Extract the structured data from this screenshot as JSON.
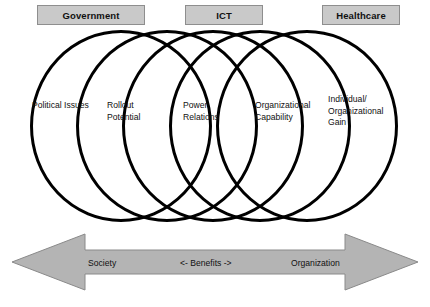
{
  "figure": {
    "type": "venn-diagram",
    "title": "",
    "headers": [
      {
        "id": "government",
        "label": "Government"
      },
      {
        "id": "ict",
        "label": "ICT"
      },
      {
        "id": "healthcare",
        "label": "Healthcare"
      }
    ],
    "regions": [
      {
        "id": "political-issues",
        "lines": [
          "Political Issues"
        ]
      },
      {
        "id": "rollout-potential",
        "lines": [
          "Rollout",
          "Potential"
        ]
      },
      {
        "id": "power-relations",
        "lines": [
          "Power",
          "Relations"
        ]
      },
      {
        "id": "organizational-capability",
        "lines": [
          "Organizational",
          "Capability"
        ]
      },
      {
        "id": "individual-org-gain",
        "lines": [
          "Individual/",
          "Organizational",
          "Gain"
        ]
      }
    ],
    "arrow": {
      "left_label": "Society",
      "center_label": "<-  Benefits  ->",
      "right_label": "Organization"
    },
    "colors": {
      "header_fill": "#c9c9c9",
      "header_border": "#8e8e8e",
      "circle_stroke": "#000000",
      "arrow_fill": "#b4b4b4",
      "arrow_stroke": "#8a8a8a",
      "background": "#ffffff",
      "text": "#111111"
    }
  }
}
